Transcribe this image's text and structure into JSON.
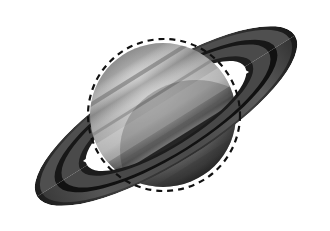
{
  "image": {
    "subject": "saturn",
    "description": "Grayscale photograph of the planet Saturn with its ring system, overlaid with a dashed circle outlining the planetary disk",
    "width": 330,
    "height": 231,
    "background_color": "#ffffff",
    "color_mode": "grayscale"
  },
  "planet": {
    "name": "planet-disk",
    "center_x": 163,
    "center_y": 115,
    "radius_x": 73,
    "radius_y": 72,
    "rotation_deg": -32,
    "limb_highlight_color": "#c9c9c9",
    "mid_tone_color": "#9a9a9a",
    "shadow_color": "#5e5e5e",
    "terminator_color": "#4a4a4a",
    "bands": [
      {
        "name": "north-polar-region",
        "tone": "#8e8e8e",
        "offset": -0.82,
        "thickness": 0.2
      },
      {
        "name": "north-temperate-belt",
        "tone": "#7c7c7c",
        "offset": -0.52,
        "thickness": 0.14
      },
      {
        "name": "north-tropical-zone",
        "tone": "#bdbdbd",
        "offset": -0.3,
        "thickness": 0.18
      },
      {
        "name": "equatorial-zone",
        "tone": "#c4c4c4",
        "offset": -0.04,
        "thickness": 0.2
      },
      {
        "name": "south-equatorial-belt",
        "tone": "#8a8a8a",
        "offset": 0.2,
        "thickness": 0.12
      },
      {
        "name": "south-temperate-zone",
        "tone": "#a8a8a8",
        "offset": 0.42,
        "thickness": 0.16
      },
      {
        "name": "south-polar-region",
        "tone": "#7a7a7a",
        "offset": 0.78,
        "thickness": 0.22
      }
    ]
  },
  "ring_system": {
    "name": "ring-system",
    "tilt_deg": -32,
    "center_x": 166,
    "center_y": 116,
    "outer_radius_x": 152,
    "outer_radius_y": 47,
    "inner_radius_x": 96,
    "inner_radius_y": 30,
    "tip_left": {
      "x": 18,
      "y": 208
    },
    "tip_right": {
      "x": 315,
      "y": 22
    },
    "rings": [
      {
        "name": "a-ring-outer-edge",
        "tone": "#2b2b2b",
        "radius_frac": 1.0
      },
      {
        "name": "a-ring",
        "tone": "#565656",
        "radius_frac": 0.93
      },
      {
        "name": "cassini-division",
        "tone": "#141414",
        "radius_frac": 0.84
      },
      {
        "name": "b-ring",
        "tone": "#4e4e4e",
        "radius_frac": 0.78
      },
      {
        "name": "c-ring-crepe",
        "tone": "#232323",
        "radius_frac": 0.66
      }
    ],
    "ring_shadow_on_planet": {
      "name": "ring-shadow-band",
      "tone": "#3a3a3a",
      "angle_deg": -32
    },
    "sky_gap_left": {
      "name": "gap-triangle-left",
      "x": 90,
      "y": 158,
      "color": "#ffffff"
    },
    "sky_gap_right": {
      "name": "gap-triangle-right",
      "x": 232,
      "y": 70,
      "color": "#ffffff"
    }
  },
  "annotation": {
    "name": "dashed-outline-circle",
    "shape": "circle",
    "center_x": 164,
    "center_y": 115,
    "radius": 76,
    "stroke_color": "#111111",
    "stroke_width": 2.2,
    "dash_length": 6,
    "gap_length": 5,
    "label": ""
  }
}
